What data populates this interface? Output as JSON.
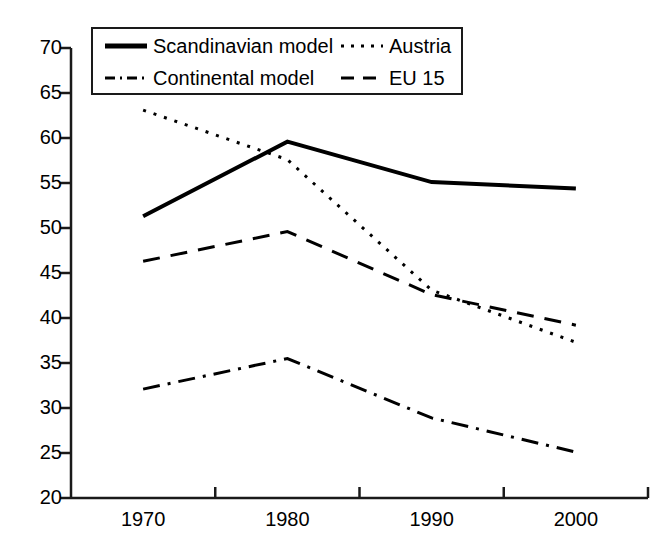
{
  "chart_data": {
    "type": "line",
    "title": "",
    "xlabel": "",
    "ylabel": "",
    "x": [
      1970,
      1980,
      1990,
      2000
    ],
    "categories": [
      "1970",
      "1980",
      "1990",
      "2000"
    ],
    "xlim": [
      1965,
      2005
    ],
    "ylim": [
      20,
      70
    ],
    "ytick_labels": [
      "70",
      "65",
      "60",
      "55",
      "50",
      "45",
      "40",
      "35",
      "30",
      "25",
      "20"
    ],
    "ytick_values": [
      70,
      65,
      60,
      55,
      50,
      45,
      40,
      35,
      30,
      25,
      20
    ],
    "xtick_labels": [
      "1970",
      "1980",
      "1990",
      "2000"
    ],
    "grid": false,
    "legend_position": "top-center-inside",
    "series": [
      {
        "name": "Scandinavian model",
        "style": "solid",
        "color": "#000000",
        "width": 4,
        "values": [
          51.3,
          59.6,
          55.1,
          54.4
        ]
      },
      {
        "name": "Austria",
        "style": "dotted",
        "color": "#000000",
        "width": 3,
        "values": [
          63.1,
          57.6,
          43.1,
          37.3
        ]
      },
      {
        "name": "Continental model",
        "style": "dashdot",
        "color": "#000000",
        "width": 3,
        "values": [
          32.1,
          35.5,
          28.9,
          25.1
        ]
      },
      {
        "name": "EU 15",
        "style": "dashed",
        "color": "#000000",
        "width": 3,
        "values": [
          46.3,
          49.6,
          42.6,
          39.2
        ]
      }
    ]
  },
  "legend": {
    "entries": [
      {
        "label": "Scandinavian model",
        "style": "solid"
      },
      {
        "label": "Austria",
        "style": "dotted"
      },
      {
        "label": "Continental model",
        "style": "dashdot"
      },
      {
        "label": "EU 15",
        "style": "dashed"
      }
    ]
  },
  "axes": {
    "y_labels": [
      "70",
      "65",
      "60",
      "55",
      "50",
      "45",
      "40",
      "35",
      "30",
      "25",
      "20"
    ],
    "x_labels": [
      "1970",
      "1980",
      "1990",
      "2000"
    ]
  },
  "colors": {
    "axis": "#1a1a1a",
    "line": "#000000",
    "background": "#ffffff"
  }
}
